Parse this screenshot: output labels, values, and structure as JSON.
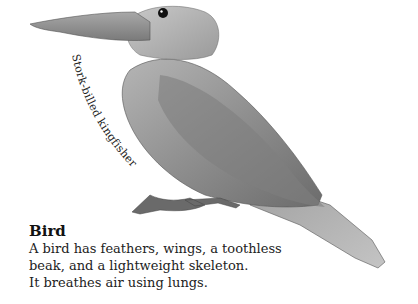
{
  "image": {
    "subject": "Stork-billed kingfisher",
    "colors": {
      "background": "#ffffff",
      "text": "#222222"
    }
  },
  "label": {
    "curved_caption": "Stork-billed kingfisher"
  },
  "info": {
    "title": "Bird",
    "lines": [
      "A bird has feathers, wings, a toothless",
      "beak, and a lightweight skeleton.",
      "It breathes air using lungs."
    ]
  }
}
